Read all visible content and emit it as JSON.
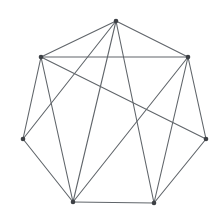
{
  "diagram": {
    "kind": "undirected-node-link-graph",
    "background_color": "#ffffff",
    "edge_color": "#60656a",
    "edge_width": 1.1,
    "vertex_color": "#3d4045",
    "vertex_radius": 2.3,
    "vertex_count": 7,
    "edge_count": 15,
    "vertices": [
      {
        "id": "v1",
        "name": "top",
        "x": 116,
        "y": 21
      },
      {
        "id": "v2",
        "name": "upper-left",
        "x": 41,
        "y": 57
      },
      {
        "id": "v3",
        "name": "upper-right",
        "x": 188,
        "y": 57
      },
      {
        "id": "v4",
        "name": "left",
        "x": 23,
        "y": 139
      },
      {
        "id": "v5",
        "name": "right",
        "x": 206,
        "y": 139
      },
      {
        "id": "v6",
        "name": "bottom-left",
        "x": 73,
        "y": 202
      },
      {
        "id": "v7",
        "name": "bottom-right",
        "x": 154,
        "y": 203
      }
    ],
    "edges": [
      [
        "v1",
        "v2"
      ],
      [
        "v1",
        "v3"
      ],
      [
        "v1",
        "v4"
      ],
      [
        "v1",
        "v6"
      ],
      [
        "v1",
        "v7"
      ],
      [
        "v2",
        "v3"
      ],
      [
        "v2",
        "v4"
      ],
      [
        "v2",
        "v5"
      ],
      [
        "v2",
        "v6"
      ],
      [
        "v3",
        "v5"
      ],
      [
        "v3",
        "v6"
      ],
      [
        "v3",
        "v7"
      ],
      [
        "v4",
        "v6"
      ],
      [
        "v5",
        "v7"
      ],
      [
        "v6",
        "v7"
      ]
    ]
  }
}
